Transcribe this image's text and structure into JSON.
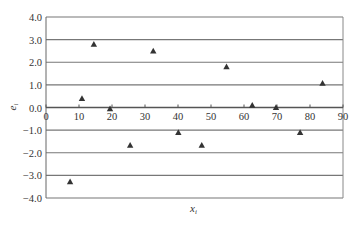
{
  "chart_data": {
    "type": "scatter",
    "title": "",
    "xlabel": "x_i",
    "ylabel": "e_i",
    "xlim": [
      0,
      90
    ],
    "ylim": [
      -4.0,
      4.0
    ],
    "x_ticks": [
      "0",
      "10",
      "20",
      "30",
      "40",
      "50",
      "60",
      "70",
      "80",
      "90"
    ],
    "y_ticks": [
      "4.0",
      "3.0",
      "2.0",
      "1.0",
      "0.0",
      "-1.0",
      "-2.0",
      "-3.0",
      "-4.0"
    ],
    "grid": "horizontal",
    "legend": "none",
    "marker": "triangle",
    "marker_color": "#333333",
    "series": [
      {
        "name": "residuals",
        "points": [
          {
            "x": 7.3,
            "y": -3.28
          },
          {
            "x": 10.9,
            "y": 0.4
          },
          {
            "x": 14.5,
            "y": 2.8
          },
          {
            "x": 19.4,
            "y": -0.05
          },
          {
            "x": 25.5,
            "y": -1.67
          },
          {
            "x": 32.5,
            "y": 2.5
          },
          {
            "x": 40.1,
            "y": -1.1
          },
          {
            "x": 47.2,
            "y": -1.67
          },
          {
            "x": 54.7,
            "y": 1.8
          },
          {
            "x": 62.5,
            "y": 0.1
          },
          {
            "x": 69.7,
            "y": 0.0
          },
          {
            "x": 77.0,
            "y": -1.1
          },
          {
            "x": 83.8,
            "y": 1.07
          }
        ]
      }
    ]
  },
  "labels": {
    "xlabel_main": "x",
    "xlabel_sub": "i",
    "ylabel_main": "e",
    "ylabel_sub": "i"
  }
}
